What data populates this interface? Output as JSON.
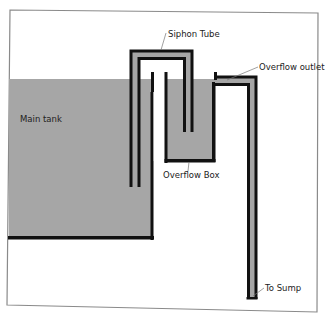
{
  "diagram": {
    "type": "aquarium-overflow-siphon-schematic",
    "labels": {
      "siphon_tube": "Siphon Tube",
      "overflow_outlet": "Overflow outlet",
      "main_tank": "Main tank",
      "overflow_box": "Overflow Box",
      "to_sump": "To Sump"
    },
    "colors": {
      "water": "#a6a6a6",
      "wall": "#111111",
      "frame": "#8a8a8a",
      "background": "#ffffff",
      "leader_line": "#777777"
    },
    "components": [
      {
        "id": "main-tank",
        "label_key": "main_tank"
      },
      {
        "id": "siphon-tube",
        "label_key": "siphon_tube"
      },
      {
        "id": "overflow-box",
        "label_key": "overflow_box"
      },
      {
        "id": "overflow-outlet",
        "label_key": "overflow_outlet"
      },
      {
        "id": "sump-pipe",
        "label_key": "to_sump"
      }
    ]
  }
}
